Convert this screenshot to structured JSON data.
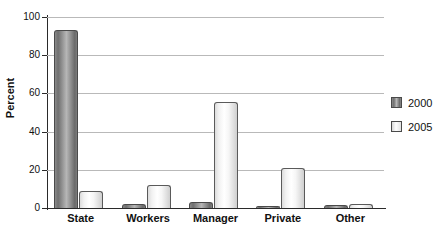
{
  "chart_data": {
    "type": "bar",
    "title": "",
    "xlabel": "",
    "ylabel": "Percent",
    "ylim": [
      0,
      100
    ],
    "yticks": [
      0,
      20,
      40,
      60,
      80,
      100
    ],
    "grid": true,
    "legend_position": "right",
    "categories": [
      "State",
      "Workers",
      "Manager",
      "Private",
      "Other"
    ],
    "series": [
      {
        "name": "2000",
        "color": "#7d7d7d",
        "values": [
          93,
          2,
          3,
          1,
          1.5
        ]
      },
      {
        "name": "2005",
        "color": "#f2f2f2",
        "values": [
          9,
          12,
          55.5,
          21,
          2
        ]
      }
    ]
  },
  "axis": {
    "y_title": "Percent",
    "y_tick_labels": [
      "100",
      "80",
      "60",
      "40",
      "20",
      "0"
    ],
    "x_tick_labels": [
      "State",
      "Workers",
      "Manager",
      "Private",
      "Other"
    ]
  },
  "legend": {
    "entries": [
      {
        "label": "2000"
      },
      {
        "label": "2005"
      }
    ]
  }
}
